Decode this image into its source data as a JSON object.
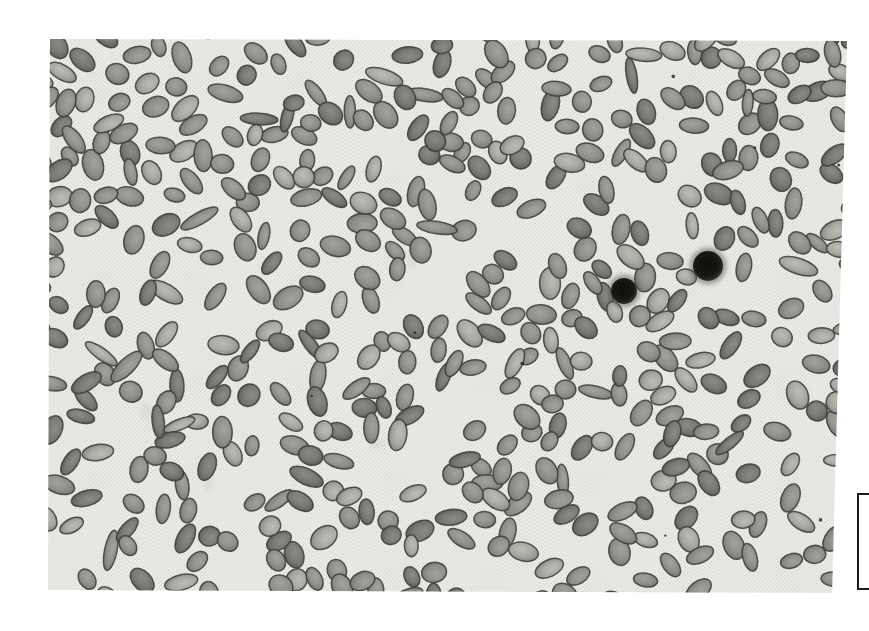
{
  "figure": {
    "type": "light-micrograph",
    "page_background": "#ffffff"
  },
  "photo": {
    "left": 48,
    "top": 39,
    "width": 799,
    "height": 554,
    "background": "#eaeae6",
    "halftone_dot_color": "#b9b9b3",
    "halftone_spacing": 2.8,
    "halftone_dot_radius": 0.6,
    "halftone_bg_opacity": 0.5,
    "halftone_overlay_opacity": 0.13
  },
  "cells": {
    "count": 500,
    "seed": 1337,
    "rx_min": 10,
    "rx_max": 16,
    "ry_min": 6.8,
    "ry_max": 10.5,
    "rod_fraction": 0.1,
    "outline_color": "#3a3a37",
    "outline_width": 1.5,
    "outline_opacity": 0.85,
    "min_spacing_factor": 0.72,
    "palette": [
      {
        "id": "pale",
        "center": "#bdbdb6",
        "mid": "#a8a8a2",
        "edge": "#8e8e88",
        "rim": "#55554f",
        "weight": 0.18
      },
      {
        "id": "mid",
        "center": "#a3a39d",
        "mid": "#90908a",
        "edge": "#7d7d77",
        "rim": "#4a4a45",
        "weight": 0.52
      },
      {
        "id": "dark",
        "center": "#8b8b85",
        "mid": "#787872",
        "edge": "#64645f",
        "rim": "#42423d",
        "weight": 0.3
      }
    ]
  },
  "dark_cells": [
    {
      "x": 576,
      "y": 252,
      "r": 13
    },
    {
      "x": 660,
      "y": 227,
      "r": 15
    }
  ],
  "dark_cell_style": {
    "core": "#0b0b09",
    "body": "#121210",
    "edge": "#23231f",
    "rim": "#45453f",
    "halo": "#55554e",
    "halo_opacity": 0.5
  },
  "specks": {
    "count": 8,
    "color": "#2b2b28",
    "r_min": 0.9,
    "r_max": 2.1,
    "opacity": 0.85
  },
  "smudges": {
    "count": 9,
    "color": "#8f8f8a",
    "opacity": 0.11,
    "r_min": 4,
    "r_max": 11
  },
  "scale_mark": {
    "left": 857,
    "top": 493,
    "width": 12,
    "height": 97,
    "thickness": 2,
    "color": "#1c1c1a"
  }
}
